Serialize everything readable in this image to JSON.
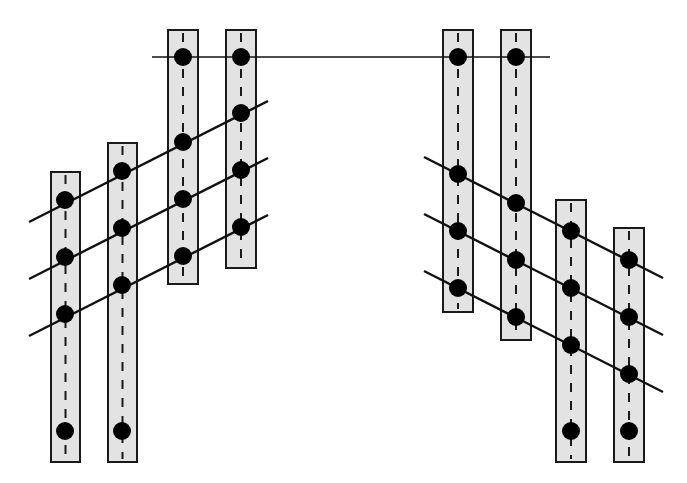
{
  "figure": {
    "canvas": {
      "width": 687,
      "height": 483,
      "background": "#ffffff"
    }
  },
  "style": {
    "bar_fill": "#e3e3e3",
    "bar_stroke": "#1a1a1a",
    "bar_stroke_width": 2,
    "centerline_stroke": "#1a1a1a",
    "centerline_width": 2,
    "centerline_dash": "9 9",
    "chord_stroke": "#111111",
    "chord_width": 2.4,
    "node_fill": "#000000",
    "node_radius": 9
  },
  "bars": [
    {
      "id": "bar-1",
      "label": "Hanger bar 1",
      "x": 51,
      "y": 172,
      "width": 29,
      "height": 290
    },
    {
      "id": "bar-2",
      "label": "Hanger bar 2",
      "x": 108,
      "y": 143,
      "width": 29,
      "height": 319
    },
    {
      "id": "bar-3",
      "label": "Hanger bar 3",
      "x": 168,
      "y": 30,
      "width": 30,
      "height": 254
    },
    {
      "id": "bar-4",
      "label": "Hanger bar 4",
      "x": 226,
      "y": 30,
      "width": 30,
      "height": 238
    },
    {
      "id": "bar-5",
      "label": "Hanger bar 5",
      "x": 443,
      "y": 30,
      "width": 30,
      "height": 282
    },
    {
      "id": "bar-6",
      "label": "Hanger bar 6",
      "x": 501,
      "y": 30,
      "width": 30,
      "height": 310
    },
    {
      "id": "bar-7",
      "label": "Hanger bar 7",
      "x": 556,
      "y": 200,
      "width": 30,
      "height": 262
    },
    {
      "id": "bar-8",
      "label": "Hanger bar 8",
      "x": 614,
      "y": 228,
      "width": 30,
      "height": 234
    }
  ],
  "chords": [
    {
      "id": "chord-top",
      "label": "Top horizontal chord",
      "x1": 152,
      "y1": 57,
      "x2": 550,
      "y2": 57
    },
    {
      "id": "chord-left-upper",
      "label": "Left upper diagonal",
      "x1": 29,
      "y1": 222,
      "x2": 268,
      "y2": 101
    },
    {
      "id": "chord-left-mid",
      "label": "Left middle diagonal",
      "x1": 29,
      "y1": 279,
      "x2": 268,
      "y2": 158
    },
    {
      "id": "chord-left-lower",
      "label": "Left lower diagonal",
      "x1": 29,
      "y1": 336,
      "x2": 268,
      "y2": 215
    },
    {
      "id": "chord-right-upper",
      "label": "Right upper diagonal",
      "x1": 424,
      "y1": 157,
      "x2": 663,
      "y2": 278
    },
    {
      "id": "chord-right-mid",
      "label": "Right middle diagonal",
      "x1": 424,
      "y1": 214,
      "x2": 663,
      "y2": 335
    },
    {
      "id": "chord-right-lower",
      "label": "Right lower diagonal",
      "x1": 424,
      "y1": 271,
      "x2": 663,
      "y2": 392
    }
  ],
  "nodes": [
    {
      "id": "n-b3-top",
      "bar": "bar-3",
      "chord": "chord-top",
      "cx": 183,
      "cy": 57
    },
    {
      "id": "n-b4-top",
      "bar": "bar-4",
      "chord": "chord-top",
      "cx": 241,
      "cy": 57
    },
    {
      "id": "n-b5-top",
      "bar": "bar-5",
      "chord": "chord-top",
      "cx": 458,
      "cy": 57
    },
    {
      "id": "n-b6-top",
      "bar": "bar-6",
      "chord": "chord-top",
      "cx": 516,
      "cy": 57
    },
    {
      "id": "n-b1-u",
      "bar": "bar-1",
      "chord": "chord-left-upper",
      "cx": 65,
      "cy": 200
    },
    {
      "id": "n-b2-u",
      "bar": "bar-2",
      "chord": "chord-left-upper",
      "cx": 122,
      "cy": 171
    },
    {
      "id": "n-b3-u",
      "bar": "bar-3",
      "chord": "chord-left-upper",
      "cx": 183,
      "cy": 142
    },
    {
      "id": "n-b4-u",
      "bar": "bar-4",
      "chord": "chord-left-upper",
      "cx": 241,
      "cy": 113
    },
    {
      "id": "n-b1-m",
      "bar": "bar-1",
      "chord": "chord-left-mid",
      "cx": 65,
      "cy": 257
    },
    {
      "id": "n-b2-m",
      "bar": "bar-2",
      "chord": "chord-left-mid",
      "cx": 122,
      "cy": 228
    },
    {
      "id": "n-b3-m",
      "bar": "bar-3",
      "chord": "chord-left-mid",
      "cx": 183,
      "cy": 199
    },
    {
      "id": "n-b4-m",
      "bar": "bar-4",
      "chord": "chord-left-mid",
      "cx": 241,
      "cy": 170
    },
    {
      "id": "n-b1-l",
      "bar": "bar-1",
      "chord": "chord-left-lower",
      "cx": 65,
      "cy": 314
    },
    {
      "id": "n-b2-l",
      "bar": "bar-2",
      "chord": "chord-left-lower",
      "cx": 122,
      "cy": 285
    },
    {
      "id": "n-b3-l",
      "bar": "bar-3",
      "chord": "chord-left-lower",
      "cx": 183,
      "cy": 256
    },
    {
      "id": "n-b4-l",
      "bar": "bar-4",
      "chord": "chord-left-lower",
      "cx": 241,
      "cy": 227
    },
    {
      "id": "n-b5-u",
      "bar": "bar-5",
      "chord": "chord-right-upper",
      "cx": 458,
      "cy": 174
    },
    {
      "id": "n-b6-u",
      "bar": "bar-6",
      "chord": "chord-right-upper",
      "cx": 516,
      "cy": 203
    },
    {
      "id": "n-b7-u",
      "bar": "bar-7",
      "chord": "chord-right-upper",
      "cx": 571,
      "cy": 231
    },
    {
      "id": "n-b8-u",
      "bar": "bar-8",
      "chord": "chord-right-upper",
      "cx": 629,
      "cy": 260
    },
    {
      "id": "n-b5-m",
      "bar": "bar-5",
      "chord": "chord-right-mid",
      "cx": 458,
      "cy": 231
    },
    {
      "id": "n-b6-m",
      "bar": "bar-6",
      "chord": "chord-right-mid",
      "cx": 516,
      "cy": 260
    },
    {
      "id": "n-b7-m",
      "bar": "bar-7",
      "chord": "chord-right-mid",
      "cx": 571,
      "cy": 288
    },
    {
      "id": "n-b8-m",
      "bar": "bar-8",
      "chord": "chord-right-mid",
      "cx": 629,
      "cy": 317
    },
    {
      "id": "n-b5-l",
      "bar": "bar-5",
      "chord": "chord-right-lower",
      "cx": 458,
      "cy": 288
    },
    {
      "id": "n-b6-l",
      "bar": "bar-6",
      "chord": "chord-right-lower",
      "cx": 516,
      "cy": 317
    },
    {
      "id": "n-b7-l",
      "bar": "bar-7",
      "chord": "chord-right-lower",
      "cx": 571,
      "cy": 345
    },
    {
      "id": "n-b8-l",
      "bar": "bar-8",
      "chord": "chord-right-lower",
      "cx": 629,
      "cy": 374
    },
    {
      "id": "n-b1-base",
      "bar": "bar-1",
      "chord": null,
      "cx": 65,
      "cy": 431
    },
    {
      "id": "n-b2-base",
      "bar": "bar-2",
      "chord": null,
      "cx": 122,
      "cy": 431
    },
    {
      "id": "n-b7-base",
      "bar": "bar-7",
      "chord": null,
      "cx": 571,
      "cy": 431
    },
    {
      "id": "n-b8-base",
      "bar": "bar-8",
      "chord": null,
      "cx": 629,
      "cy": 431
    }
  ]
}
